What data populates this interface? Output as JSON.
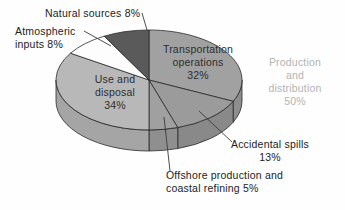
{
  "chart_data": {
    "type": "pie",
    "style": "3d",
    "title": "",
    "legend": "none",
    "background": "#fefefe",
    "outline_color": "#2a2a2a",
    "leader_color": "#3a3a3a",
    "geometry": {
      "cx": 149,
      "cy": 80,
      "rx": 93,
      "ry": 50,
      "depth": 21,
      "start_angle_deg": 0,
      "direction": "clockwise-from-top"
    },
    "slices": [
      {
        "name": "transportation-operations",
        "label": "Transportation\noperations\n32%",
        "value": 32,
        "color": "#a1a1a1",
        "side_color": "#8d8d8d",
        "label_placement": "inside"
      },
      {
        "name": "accidental-spills",
        "label": "Accidental spills\n13%",
        "value": 13,
        "color": "#9b9b9b",
        "side_color": "#898989",
        "label_placement": "outside"
      },
      {
        "name": "offshore-production-coastal-refining",
        "label": "Offshore production and\ncoastal refining  5%",
        "value": 5,
        "color": "#a0a0a0",
        "side_color": "#8f8f8f",
        "label_placement": "outside"
      },
      {
        "name": "use-and-disposal",
        "label": "Use and\ndisposal\n34%",
        "value": 34,
        "color": "#b8b8b8",
        "side_color": "#a5a5a5",
        "label_placement": "inside"
      },
      {
        "name": "atmospheric-inputs",
        "label": "Atmospheric\ninputs  8%",
        "value": 8,
        "color": "#fdfdfd",
        "side_color": "#e6e6e6",
        "label_placement": "outside"
      },
      {
        "name": "natural-sources",
        "label": "Natural sources  8%",
        "value": 8,
        "color": "#5a5a5a",
        "side_color": "#484848",
        "label_placement": "outside"
      }
    ],
    "group_annotation": {
      "label": "Production\nand\ndistribution\n50%",
      "value": 50,
      "color": "#b3b3b3",
      "includes": [
        "transportation-operations",
        "accidental-spills",
        "offshore-production-coastal-refining"
      ]
    },
    "leader_lines": [
      {
        "for": "natural-sources",
        "x1": 142,
        "y1": 13,
        "x2": 147,
        "y2": 30
      },
      {
        "for": "atmospheric-inputs",
        "x1": 84,
        "y1": 31,
        "x2": 111,
        "y2": 46
      },
      {
        "for": "accidental-spills",
        "x1": 232,
        "y1": 142,
        "x2": 199,
        "y2": 111
      },
      {
        "for": "offshore-production-coastal-refining",
        "x1": 170,
        "y1": 171,
        "x2": 164,
        "y2": 117
      }
    ]
  }
}
